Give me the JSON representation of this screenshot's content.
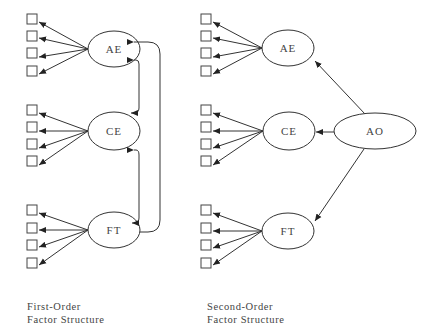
{
  "diagram": {
    "stroke_color": "#333333",
    "text_color": "#444444",
    "first_order": {
      "caption_line1": "First-Order",
      "caption_line2": "Factor Structure",
      "factors": [
        {
          "id": "AE",
          "label": "AE",
          "cx": 114,
          "cy": 49,
          "rx": 26,
          "ry": 18,
          "indicator_ys": [
            19,
            36,
            53,
            71
          ]
        },
        {
          "id": "CE",
          "label": "CE",
          "cx": 114,
          "cy": 131,
          "rx": 26,
          "ry": 19,
          "indicator_ys": [
            110,
            127,
            144,
            161
          ]
        },
        {
          "id": "FT",
          "label": "FT",
          "cx": 114,
          "cy": 230,
          "rx": 26,
          "ry": 18,
          "indicator_ys": [
            210,
            228,
            245,
            263
          ]
        }
      ],
      "indicator_x": 27,
      "correlations": [
        {
          "from": "AE",
          "to": "CE"
        },
        {
          "from": "CE",
          "to": "FT"
        },
        {
          "from": "AE",
          "to": "FT"
        }
      ]
    },
    "second_order": {
      "caption_line1": "Second-Order",
      "caption_line2": "Factor Structure",
      "factors": [
        {
          "id": "AE",
          "label": "AE",
          "cx": 288,
          "cy": 48,
          "rx": 26,
          "ry": 18,
          "indicator_ys": [
            19,
            36,
            53,
            71
          ]
        },
        {
          "id": "CE",
          "label": "CE",
          "cx": 289,
          "cy": 131,
          "rx": 26,
          "ry": 19,
          "indicator_ys": [
            110,
            127,
            144,
            161
          ]
        },
        {
          "id": "FT",
          "label": "FT",
          "cx": 288,
          "cy": 231,
          "rx": 26,
          "ry": 18,
          "indicator_ys": [
            210,
            228,
            245,
            263
          ]
        }
      ],
      "indicator_x": 201,
      "higher_order": {
        "id": "AO",
        "label": "AO",
        "cx": 375,
        "cy": 131,
        "rx": 41,
        "ry": 18
      },
      "paths": [
        {
          "from": "AO",
          "to": "AE"
        },
        {
          "from": "AO",
          "to": "CE"
        },
        {
          "from": "AO",
          "to": "FT"
        }
      ]
    }
  }
}
